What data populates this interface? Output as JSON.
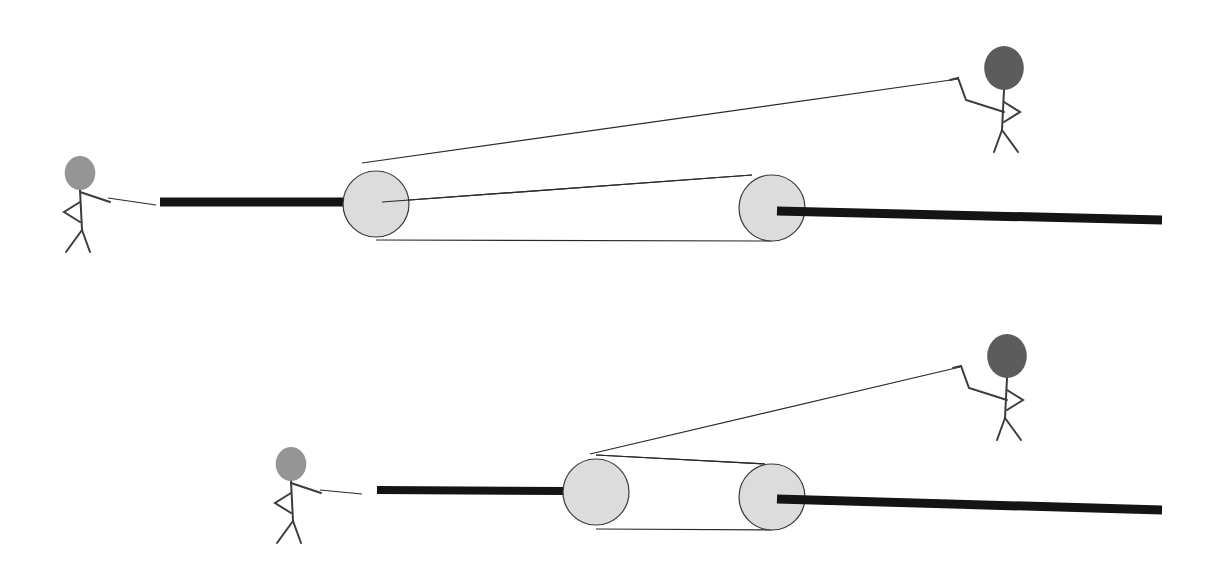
{
  "canvas": {
    "width": 1222,
    "height": 568,
    "background": "#ffffff"
  },
  "colors": {
    "bar": "#141414",
    "rope": "#2a2a2a",
    "pulley_fill": "#dcdcdc",
    "pulley_stroke": "#3a3a3a",
    "stick": "#3c3c3c",
    "head_left": "#8a8a8a",
    "head_right": "#4a4a4a"
  },
  "scenes": [
    {
      "id": "top",
      "left_bar": {
        "x1": 160,
        "y1": 202,
        "x2": 346,
        "y2": 202,
        "w": 9
      },
      "right_bar": {
        "x1": 777,
        "y1": 211,
        "x2": 1162,
        "y2": 220,
        "w": 9
      },
      "pulley_a": {
        "cx": 376,
        "cy": 204,
        "r": 33
      },
      "pulley_b": {
        "cx": 772,
        "cy": 208,
        "r": 33
      },
      "ropes": [
        {
          "x1": 362,
          "y1": 163,
          "x2": 958,
          "y2": 79
        },
        {
          "x1": 382,
          "y1": 202,
          "x2": 752,
          "y2": 175
        },
        {
          "x1": 376,
          "y1": 240,
          "x2": 772,
          "y2": 241
        },
        {
          "x1": 108,
          "y1": 198,
          "x2": 156,
          "y2": 205
        }
      ],
      "person_left": {
        "head_cx": 80,
        "head_cy": 173,
        "head_r": 17,
        "x": 80,
        "y": 190,
        "facing": "right",
        "head": "head_left"
      },
      "person_right": {
        "head_cx": 1004,
        "head_cy": 68,
        "head_r": 22,
        "x": 1004,
        "y": 90,
        "facing": "left",
        "head": "head_right"
      }
    },
    {
      "id": "bottom",
      "left_bar": {
        "x1": 377,
        "y1": 490,
        "x2": 565,
        "y2": 491,
        "w": 8
      },
      "right_bar": {
        "x1": 777,
        "y1": 499,
        "x2": 1162,
        "y2": 510,
        "w": 9
      },
      "pulley_a": {
        "cx": 596,
        "cy": 492,
        "r": 33
      },
      "pulley_b": {
        "cx": 772,
        "cy": 497,
        "r": 33
      },
      "ropes": [
        {
          "x1": 590,
          "y1": 454,
          "x2": 960,
          "y2": 367
        },
        {
          "x1": 596,
          "y1": 455,
          "x2": 765,
          "y2": 464
        },
        {
          "x1": 596,
          "y1": 529,
          "x2": 772,
          "y2": 530
        },
        {
          "x1": 320,
          "y1": 490,
          "x2": 362,
          "y2": 494
        }
      ],
      "person_left": {
        "head_cx": 291,
        "head_cy": 464,
        "head_r": 17,
        "x": 291,
        "y": 481,
        "facing": "right",
        "head": "head_left"
      },
      "person_right": {
        "head_cx": 1007,
        "head_cy": 356,
        "head_r": 22,
        "x": 1007,
        "y": 378,
        "facing": "left",
        "head": "head_right"
      }
    }
  ]
}
